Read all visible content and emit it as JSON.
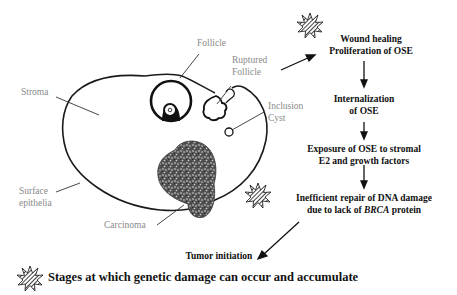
{
  "diagram": {
    "anatomy_labels": {
      "follicle": "Follicle",
      "ruptured_follicle_line1": "Ruptured",
      "ruptured_follicle_line2": "Follicle",
      "stroma": "Stroma",
      "inclusion_cyst_line1": "Inclusion",
      "inclusion_cyst_line2": "Cyst",
      "surface_epithelia_line1": "Surface",
      "surface_epithelia_line2": "epithelia",
      "carcinoma": "Carcinoma"
    },
    "flow_steps": [
      {
        "line1": "Wound healing",
        "line2": "Proliferation of OSE",
        "damage_marker": true
      },
      {
        "line1": "Internalization",
        "line2": "of OSE",
        "damage_marker": false
      },
      {
        "line1": "Exposure of OSE to stromal",
        "line2": "E2 and growth factors",
        "damage_marker": false
      },
      {
        "line1": "Inefficient repair of DNA damage",
        "line2_pre": "due to lack of ",
        "line2_italic": "BRCA",
        "line2_post": " protein",
        "damage_marker": true
      },
      {
        "line1": "Tumor initiation",
        "damage_marker": false
      }
    ],
    "legend": {
      "icon": "hatched-starburst-icon",
      "text": "Stages at which genetic damage can occur and accumulate"
    },
    "colors": {
      "label_gray": "#8a8a8a",
      "text_dark": "#111111",
      "outline": "#1a1a1a"
    }
  }
}
